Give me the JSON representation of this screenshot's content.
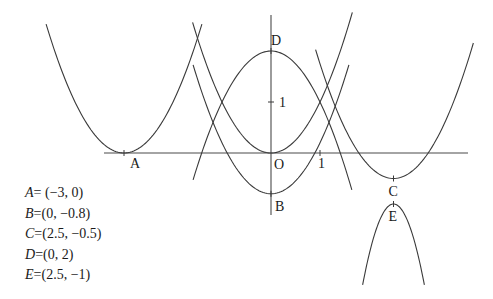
{
  "diagram": {
    "type": "function-graph",
    "origin_px": [
      271,
      153
    ],
    "scale_px": [
      49,
      51
    ],
    "axes": {
      "x": {
        "from_px": 104,
        "to_px": 468,
        "tick_label": "1",
        "tick_value": 1
      },
      "y": {
        "from_px": 15,
        "to_px": 215,
        "tick_label": "1",
        "tick_value": 1
      },
      "origin_label": "O"
    },
    "curves": [
      {
        "name": "parabola-A",
        "a": 1,
        "h": -3,
        "k": 0,
        "x_range": [
          -4.59,
          -1.41
        ]
      },
      {
        "name": "parabola-O",
        "a": 1,
        "h": 0,
        "k": 0,
        "x_range": [
          -1.6,
          1.66
        ]
      },
      {
        "name": "parabola-D",
        "a": -1,
        "h": 0,
        "k": 2,
        "x_range": [
          -1.59,
          1.65
        ]
      },
      {
        "name": "parabola-B",
        "a": 1,
        "h": 0,
        "k": -0.8,
        "x_range": [
          -1.59,
          1.59
        ]
      },
      {
        "name": "parabola-C",
        "a": 1,
        "h": 2.5,
        "k": -0.5,
        "x_range": [
          0.91,
          4.13
        ]
      },
      {
        "name": "parabola-E",
        "a": -4,
        "h": 2.5,
        "k": -1,
        "x_range": [
          1.87,
          3.13
        ]
      }
    ],
    "points": [
      {
        "label": "A",
        "x": -3,
        "y": 0,
        "label_dx": 6,
        "label_dy": 15
      },
      {
        "label": "B",
        "x": 0,
        "y": -0.8,
        "label_dx": 4,
        "label_dy": 17
      },
      {
        "label": "C",
        "x": 2.5,
        "y": -0.5,
        "label_dx": -5,
        "label_dy": 17
      },
      {
        "label": "D",
        "x": 0,
        "y": 2,
        "label_dx": 0,
        "label_dy": -6
      },
      {
        "label": "E",
        "x": 2.5,
        "y": -1,
        "label_dx": -5,
        "label_dy": 17
      }
    ]
  },
  "legend": [
    {
      "var": "A",
      "eq": "=",
      "value": " (−3, 0)"
    },
    {
      "var": "B",
      "eq": "=",
      "value": "(0, −0.8)"
    },
    {
      "var": "C",
      "eq": "=",
      "value": "(2.5, −0.5)"
    },
    {
      "var": "D",
      "eq": "=",
      "value": "(0, 2)"
    },
    {
      "var": "E",
      "eq": "=",
      "value": "(2.5, −1)"
    }
  ],
  "colors": {
    "stroke": "#3a3a3a",
    "text": "#1a1a1a",
    "background": "#ffffff"
  }
}
